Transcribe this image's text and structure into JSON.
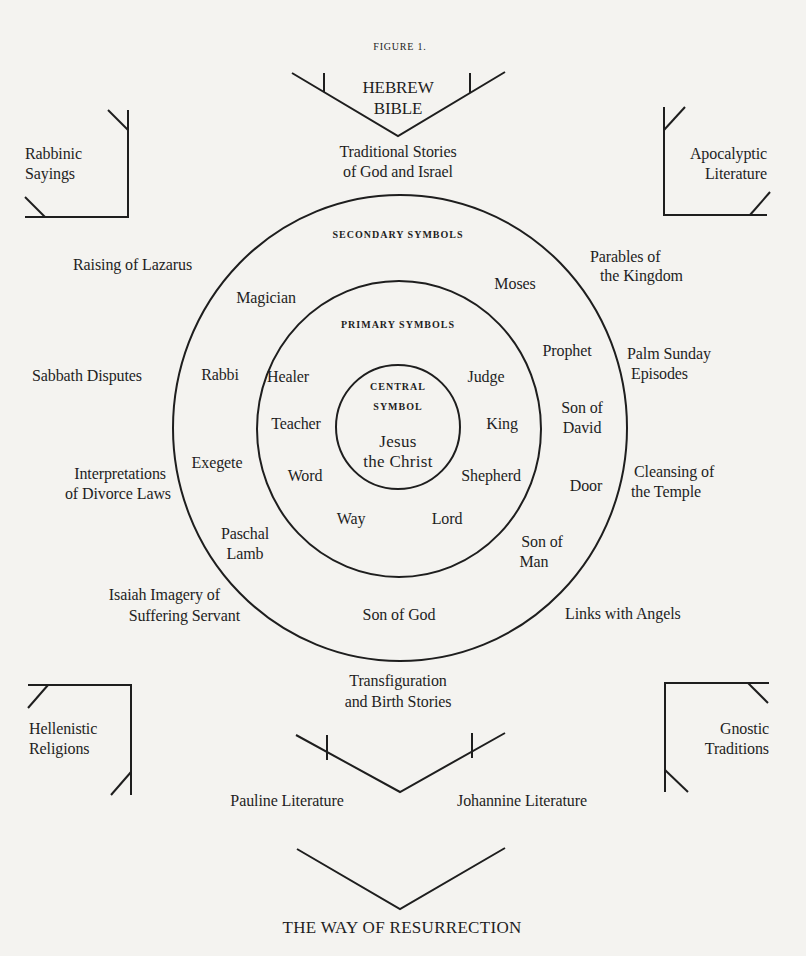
{
  "figure_label": "FIGURE 1.",
  "top_source": {
    "title_line1": "HEBREW",
    "title_line2": "BIBLE"
  },
  "traditional_stories": {
    "line1": "Traditional Stories",
    "line2": "of God and Israel"
  },
  "corners": {
    "top_left": {
      "line1": "Rabbinic",
      "line2": "Sayings"
    },
    "top_right": {
      "line1": "Apocalyptic",
      "line2": "Literature"
    },
    "bottom_left": {
      "line1": "Hellenistic",
      "line2": "Religions"
    },
    "bottom_right": {
      "line1": "Gnostic",
      "line2": "Traditions"
    }
  },
  "rings": {
    "secondary_heading": "SECONDARY SYMBOLS",
    "primary_heading": "PRIMARY SYMBOLS",
    "central_heading_line1": "CENTRAL",
    "central_heading_line2": "SYMBOL",
    "central_line1": "Jesus",
    "central_line2": "the Christ"
  },
  "primary_symbols": [
    "Healer",
    "Judge",
    "Teacher",
    "King",
    "Word",
    "Shepherd",
    "Way",
    "Lord"
  ],
  "secondary_symbols": {
    "magician": "Magician",
    "moses": "Moses",
    "rabbi": "Rabbi",
    "prophet": "Prophet",
    "son_of_david_1": "Son of",
    "son_of_david_2": "David",
    "exegete": "Exegete",
    "door": "Door",
    "paschal_1": "Paschal",
    "paschal_2": "Lamb",
    "son_of_man_1": "Son of",
    "son_of_man_2": "Man",
    "son_of_god": "Son of God"
  },
  "episodes": {
    "lazarus": "Raising of Lazarus",
    "parables_1": "Parables of",
    "parables_2": "the Kingdom",
    "sabbath": "Sabbath Disputes",
    "palm_1": "Palm Sunday",
    "palm_2": "Episodes",
    "divorce_1": "Interpretations",
    "divorce_2": "of Divorce Laws",
    "temple_1": "Cleansing of",
    "temple_2": "the Temple",
    "isaiah_1": "Isaiah Imagery of",
    "isaiah_2": "Suffering Servant",
    "angels": "Links with Angels",
    "transfig_1": "Transfiguration",
    "transfig_2": "and Birth Stories"
  },
  "outputs": {
    "pauline": "Pauline Literature",
    "johannine": "Johannine Literature"
  },
  "conclusion": "THE WAY OF RESURRECTION"
}
